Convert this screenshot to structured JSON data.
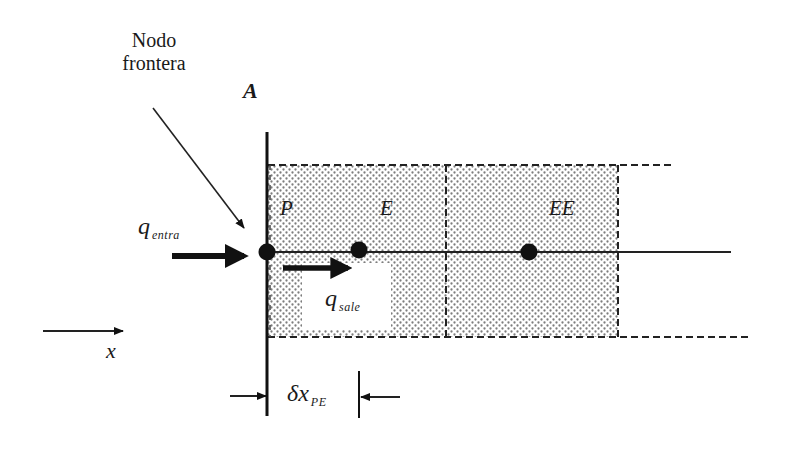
{
  "diagram": {
    "title_label": {
      "line1": "Nodo",
      "line2": "frontera"
    },
    "boundary_label": "A",
    "nodes": [
      {
        "id": "P",
        "label": "P",
        "type": "boundary-node"
      },
      {
        "id": "E",
        "label": "E",
        "type": "interior-node"
      },
      {
        "id": "EE",
        "label": "EE",
        "type": "interior-node"
      }
    ],
    "flux_in": {
      "symbol": "q",
      "subscript": "entra"
    },
    "flux_out": {
      "symbol": "q",
      "subscript": "sale"
    },
    "axis": {
      "label": "x"
    },
    "spacing": {
      "symbol": "δx",
      "subscript": "PE"
    },
    "colors": {
      "ink": "#1a1a1a",
      "fill_dots": "#8a8a8a",
      "background": "#ffffff"
    }
  }
}
